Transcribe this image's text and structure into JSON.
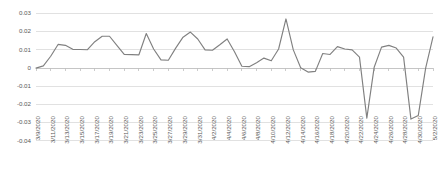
{
  "chart_data": {
    "type": "line",
    "title": "",
    "subtitle": "",
    "xlabel": "",
    "ylabel": "",
    "ylim": [
      -0.04,
      0.03
    ],
    "ytick_values": [
      0.03,
      0.02,
      0.01,
      0,
      -0.01,
      -0.02,
      -0.03,
      -0.04
    ],
    "ytick_labels": [
      "0.03",
      "0.02",
      "0.01",
      "0",
      "-0.01",
      "-0.02",
      "-0.03",
      "-0.04"
    ],
    "grid": true,
    "grid_axis": "y",
    "legend": false,
    "legend_position": "none",
    "xtick_rotation": 90,
    "xtick_interval_days": 2,
    "x_labels": [
      "3/9/2020",
      "3/11/2020",
      "3/13/2020",
      "3/15/2020",
      "3/17/2020",
      "3/19/2020",
      "3/21/2020",
      "3/23/2020",
      "3/25/2020",
      "3/27/2020",
      "3/29/2020",
      "3/31/2020",
      "4/2/2020",
      "4/4/2020",
      "4/6/2020",
      "4/8/2020",
      "4/10/2020",
      "4/12/2020",
      "4/14/2020",
      "4/16/2020",
      "4/18/2020",
      "4/20/2020",
      "4/22/2020",
      "4/24/2020",
      "4/26/2020",
      "4/28/2020",
      "4/30/2020",
      "5/2/2020"
    ],
    "x": [
      "3/9/2020",
      "3/10/2020",
      "3/11/2020",
      "3/12/2020",
      "3/13/2020",
      "3/14/2020",
      "3/15/2020",
      "3/16/2020",
      "3/17/2020",
      "3/18/2020",
      "3/19/2020",
      "3/20/2020",
      "3/21/2020",
      "3/22/2020",
      "3/23/2020",
      "3/24/2020",
      "3/25/2020",
      "3/26/2020",
      "3/27/2020",
      "3/28/2020",
      "3/29/2020",
      "3/30/2020",
      "3/31/2020",
      "4/1/2020",
      "4/2/2020",
      "4/3/2020",
      "4/4/2020",
      "4/5/2020",
      "4/6/2020",
      "4/7/2020",
      "4/8/2020",
      "4/9/2020",
      "4/10/2020",
      "4/11/2020",
      "4/12/2020",
      "4/13/2020",
      "4/14/2020",
      "4/15/2020",
      "4/16/2020",
      "4/17/2020",
      "4/18/2020",
      "4/19/2020",
      "4/20/2020",
      "4/21/2020",
      "4/22/2020",
      "4/23/2020",
      "4/24/2020",
      "4/25/2020",
      "4/26/2020",
      "4/27/2020",
      "4/28/2020",
      "4/29/2020",
      "4/30/2020",
      "5/1/2020",
      "5/2/2020"
    ],
    "values": [
      0.0,
      0.0012,
      0.0065,
      0.013,
      0.0125,
      0.0103,
      0.0102,
      0.0101,
      0.0145,
      0.0175,
      0.0175,
      0.0125,
      0.0075,
      0.0074,
      0.0073,
      0.019,
      0.0105,
      0.0045,
      0.0043,
      0.011,
      0.017,
      0.0198,
      0.016,
      0.01,
      0.0098,
      0.0128,
      0.016,
      0.009,
      0.001,
      0.0008,
      0.003,
      0.0055,
      0.004,
      0.0105,
      0.027,
      0.01,
      0.0002,
      -0.0022,
      -0.0018,
      0.008,
      0.0075,
      0.0118,
      0.0105,
      0.01,
      0.006,
      -0.0275,
      0.0005,
      0.0115,
      0.0125,
      0.011,
      0.006,
      -0.028,
      -0.026,
      0.0,
      0.0172
    ],
    "series": [
      {
        "name": "series-1",
        "color": "#808080",
        "values": [
          0.0,
          0.0012,
          0.0065,
          0.013,
          0.0125,
          0.0103,
          0.0102,
          0.0101,
          0.0145,
          0.0175,
          0.0175,
          0.0125,
          0.0075,
          0.0074,
          0.0073,
          0.019,
          0.0105,
          0.0045,
          0.0043,
          0.011,
          0.017,
          0.0198,
          0.016,
          0.01,
          0.0098,
          0.0128,
          0.016,
          0.009,
          0.001,
          0.0008,
          0.003,
          0.0055,
          0.004,
          0.0105,
          0.027,
          0.01,
          0.0002,
          -0.0022,
          -0.0018,
          0.008,
          0.0075,
          0.0118,
          0.0105,
          0.01,
          0.006,
          -0.0275,
          0.0005,
          0.0115,
          0.0125,
          0.011,
          0.006,
          -0.028,
          -0.026,
          0.0,
          0.0172
        ]
      }
    ]
  },
  "colors": {
    "line": "#808080",
    "grid": "#d9d9d9",
    "zero_axis": "#bfbfbf",
    "tick_text": "#595959",
    "background": "#ffffff"
  }
}
